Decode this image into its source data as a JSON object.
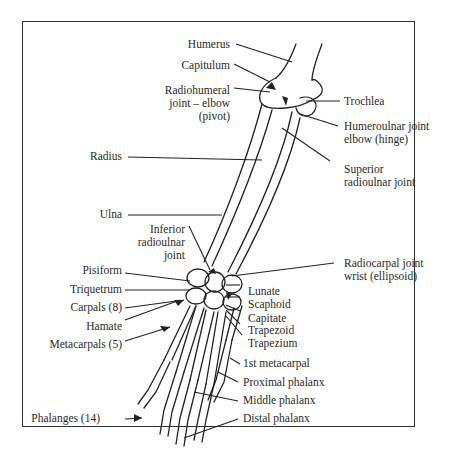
{
  "diagram": {
    "labels_left": {
      "humerus": "Humerus",
      "capitulum": "Capitulum",
      "radiohumeral_1": "Radiohumeral",
      "radiohumeral_2": "joint – elbow",
      "radiohumeral_3": "(pivot)",
      "radius": "Radius",
      "ulna": "Ulna",
      "inferior_1": "Inferior",
      "inferior_2": "radioulnar",
      "inferior_3": "joint",
      "pisiform": "Pisiform",
      "triquetrum": "Triquetrum",
      "carpals": "Carpals (8)",
      "hamate": "Hamate",
      "metacarpals": "Metacarpals (5)",
      "phalanges": "Phalanges (14)"
    },
    "labels_right": {
      "trochlea": "Trochlea",
      "humeroulnar_1": "Humeroulnar joint",
      "humeroulnar_2": "elbow (hinge)",
      "superior_1": "Superior",
      "superior_2": "radioulnar joint",
      "radiocarpal_1": "Radiocarpal joint",
      "radiocarpal_2": "wrist (ellipsoid)",
      "lunate": "Lunate",
      "scaphoid": "Scaphoid",
      "capitate": "Capitate",
      "trapezoid": "Trapezoid",
      "trapezium": "Trapezium",
      "first_metacarpal": "1st metacarpal",
      "proximal": "Proximal phalanx",
      "middle": "Middle phalanx",
      "distal": "Distal phalanx"
    }
  }
}
